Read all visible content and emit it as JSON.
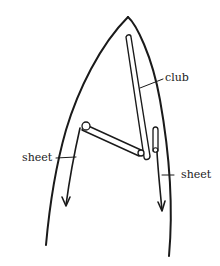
{
  "diagram": {
    "type": "sail rig sketch",
    "stroke_color": "#1a1a1a",
    "background": "#ffffff"
  },
  "labels": {
    "club": "club",
    "sheet_left": "sheet",
    "sheet_right": "sheet"
  }
}
